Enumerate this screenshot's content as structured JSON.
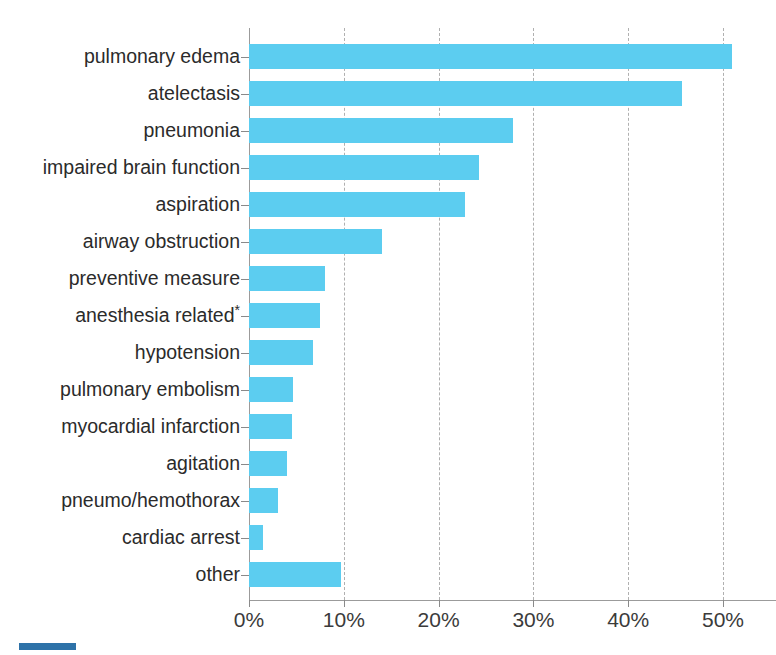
{
  "chart_data": {
    "type": "bar",
    "orientation": "horizontal",
    "title": "",
    "subtitle": "",
    "xlabel": "",
    "ylabel": "",
    "xlim": [
      0,
      53
    ],
    "axis_unit": "%",
    "grid": "vertical dashed gridlines at each x tick",
    "legend": "none",
    "bar_color": "#5CCDF0",
    "axis_color": "#9B9B9B",
    "gridline_color": "#B0B0B0",
    "text_color": "#2B2B2B",
    "xticks": [
      {
        "value": 0,
        "label": "0%"
      },
      {
        "value": 10,
        "label": "10%"
      },
      {
        "value": 20,
        "label": "20%"
      },
      {
        "value": 30,
        "label": "30%"
      },
      {
        "value": 40,
        "label": "40%"
      },
      {
        "value": 50,
        "label": "50%"
      }
    ],
    "categories": [
      "pulmonary edema",
      "atelectasis",
      "pneumonia",
      "impaired brain function",
      "aspiration",
      "airway obstruction",
      "preventive measure",
      "anesthesia related*",
      "hypotension",
      "pulmonary embolism",
      "myocardial infarction",
      "agitation",
      "pneumo/hemothorax",
      "cardiac arrest",
      "other"
    ],
    "values": [
      51.0,
      45.7,
      27.9,
      24.3,
      22.8,
      14.0,
      8.0,
      7.5,
      6.8,
      4.6,
      4.5,
      4.0,
      3.1,
      1.5,
      9.7
    ],
    "bars": [
      {
        "label": "pulmonary edema",
        "value": 51.0
      },
      {
        "label": "atelectasis",
        "value": 45.7
      },
      {
        "label": "pneumonia",
        "value": 27.9
      },
      {
        "label": "impaired brain function",
        "value": 24.3
      },
      {
        "label": "aspiration",
        "value": 22.8
      },
      {
        "label": "airway obstruction",
        "value": 14.0
      },
      {
        "label": "preventive measure",
        "value": 8.0
      },
      {
        "label": "anesthesia related*",
        "value": 7.5
      },
      {
        "label": "hypotension",
        "value": 6.8
      },
      {
        "label": "pulmonary embolism",
        "value": 4.6
      },
      {
        "label": "myocardial infarction",
        "value": 4.5
      },
      {
        "label": "agitation",
        "value": 4.0
      },
      {
        "label": "pneumo/hemothorax",
        "value": 3.1
      },
      {
        "label": "cardiac arrest",
        "value": 1.5
      },
      {
        "label": "other",
        "value": 9.7
      }
    ]
  }
}
